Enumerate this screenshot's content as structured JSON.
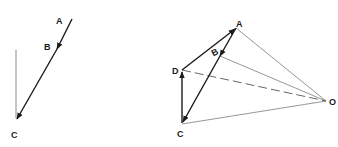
{
  "left_figure": {
    "labels": {
      "A": "A",
      "B": "B",
      "C": "C"
    },
    "points": {
      "A": [
        72,
        19
      ],
      "B": [
        57,
        48
      ],
      "C": [
        16,
        120
      ],
      "vertical_top": [
        16,
        50
      ]
    }
  },
  "right_figure": {
    "labels": {
      "A": "A",
      "B": "B",
      "C": "C",
      "D": "D",
      "O": "O"
    },
    "points": {
      "A": [
        236,
        28
      ],
      "B": [
        219,
        55
      ],
      "C": [
        182,
        124
      ],
      "D": [
        181,
        70
      ],
      "O": [
        326,
        101
      ]
    }
  },
  "colors": {
    "dark_line": "#1a1a1a",
    "light_line": "#8a8a8a"
  }
}
